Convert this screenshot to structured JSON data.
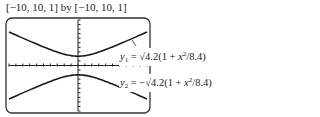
{
  "window_label": "[−10, 10, 1] by [−10, 10, 1]",
  "chart_data": {
    "type": "line",
    "title": "[−10, 10, 1] by [−10, 10, 1]",
    "xlim": [
      -10,
      10
    ],
    "ylim": [
      -10,
      10
    ],
    "xscl": 1,
    "yscl": 1,
    "grid": false,
    "series": [
      {
        "name": "y1 = √4.2(1 + x²/8.4)",
        "x": [
          -10,
          -8,
          -6,
          -4,
          -2,
          0,
          2,
          4,
          6,
          8,
          10
        ],
        "values": [
          7.69,
          6.35,
          5.06,
          3.85,
          2.83,
          2.05,
          2.83,
          3.85,
          5.06,
          6.35,
          7.69
        ]
      },
      {
        "name": "y2 = −√4.2(1 + x²/8.4)",
        "x": [
          -10,
          -8,
          -6,
          -4,
          -2,
          0,
          2,
          4,
          6,
          8,
          10
        ],
        "values": [
          -7.69,
          -6.35,
          -5.06,
          -3.85,
          -2.83,
          -2.05,
          -2.83,
          -3.85,
          -5.06,
          -6.35,
          -7.69
        ]
      }
    ]
  },
  "labels": {
    "y1": {
      "var": "y",
      "sub": "1",
      "eq": " = √4.2(1 + ",
      "x": "x",
      "sup": "2",
      "tail": "/8.4)"
    },
    "y2": {
      "var": "y",
      "sub": "2",
      "eq": " = −√4.2(1 + ",
      "x": "x",
      "sup": "2",
      "tail": "/8.4)"
    }
  }
}
